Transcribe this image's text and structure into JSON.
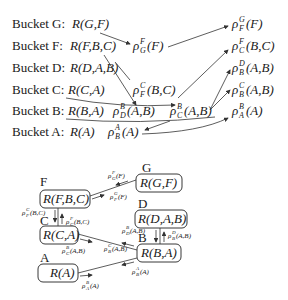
{
  "bucket_diagram": {
    "rows": [
      {
        "label": "Bucket G:",
        "relation": "R(G,F)"
      },
      {
        "label": "Bucket F:",
        "relation": "R(F,B,C)",
        "messages": [
          {
            "rho": "ρ",
            "sup": "F",
            "sub": "G",
            "arg": "(F)"
          }
        ]
      },
      {
        "label": "Bucket D:",
        "relation": "R(D,A,B)"
      },
      {
        "label": "Bucket C:",
        "relation": "R(C,A)",
        "messages": [
          {
            "rho": "ρ",
            "sup": "C",
            "sub": "F",
            "arg": "(B,C)"
          }
        ]
      },
      {
        "label": "Bucket B:",
        "relation": "R(B,A)",
        "messages": [
          {
            "rho": "ρ",
            "sup": "B",
            "sub": "D",
            "arg": "(A,B)"
          },
          {
            "rho": "ρ",
            "sup": "B",
            "sub": "C",
            "arg": "(A,B)"
          }
        ]
      },
      {
        "label": "Bucket A:",
        "relation": "R(A)",
        "messages": [
          {
            "rho": "ρ",
            "sup": "A",
            "sub": "B",
            "arg": "(A)"
          }
        ]
      }
    ],
    "right_column": [
      {
        "rho": "ρ",
        "sup": "G",
        "sub": "F",
        "arg": "(F)"
      },
      {
        "rho": "ρ",
        "sup": "F",
        "sub": "C",
        "arg": "(B,C)"
      },
      {
        "rho": "ρ",
        "sup": "D",
        "sub": "B",
        "arg": "(A,B)"
      },
      {
        "rho": "ρ",
        "sup": "C",
        "sub": "B",
        "arg": "(A,B)"
      },
      {
        "rho": "ρ",
        "sup": "B",
        "sub": "A",
        "arg": "(A)"
      }
    ]
  },
  "tree_diagram": {
    "nodes": [
      {
        "id": "G",
        "letter": "G",
        "relation": "R(G,F)"
      },
      {
        "id": "F",
        "letter": "F",
        "relation": "R(F,B,C)"
      },
      {
        "id": "D",
        "letter": "D",
        "relation": "R(D,A,B)"
      },
      {
        "id": "C",
        "letter": "C",
        "relation": "R(C,A)"
      },
      {
        "id": "B",
        "letter": "B",
        "relation": "R(B,A)"
      },
      {
        "id": "A",
        "letter": "A",
        "relation": "R(A)"
      }
    ],
    "edge_messages": {
      "G_to_F": "ρ_G^F(F)",
      "F_to_G": "ρ_F^G(F)",
      "F_to_C": "ρ_F^C(B,C)",
      "C_to_F": "ρ_C^F(B,C)",
      "C_to_B": "ρ_C^B(A,B)",
      "B_to_C": "ρ_B^C(A,B)",
      "D_to_B": "ρ_D^B(A,B)",
      "B_to_D": "ρ_B^D(A,B)",
      "A_to_B": "ρ_A^B(A)",
      "B_to_A": "ρ_B^A(A)"
    }
  }
}
